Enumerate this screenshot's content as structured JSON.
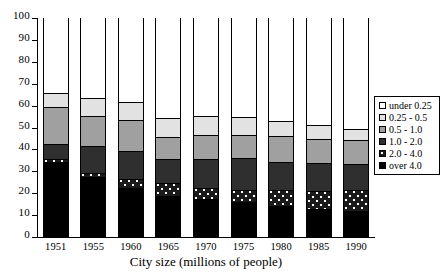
{
  "chart_data": {
    "type": "bar",
    "subtype": "stacked-bar-100-percent",
    "title": "",
    "xlabel": "City size (millions of people)",
    "ylabel": "",
    "ylim": [
      0,
      100
    ],
    "yticks": [
      0,
      10,
      20,
      30,
      40,
      50,
      60,
      70,
      80,
      90,
      100
    ],
    "grid": false,
    "legend_position": "right",
    "categories": [
      "1951",
      "1955",
      "1960",
      "1965",
      "1970",
      "1975",
      "1980",
      "1985",
      "1990"
    ],
    "series": [
      {
        "name": "over 4.0",
        "color": "#000000",
        "pattern": "solid-black",
        "values": [
          34.0,
          27.0,
          22.0,
          18.5,
          17.0,
          15.5,
          13.5,
          12.5,
          11.5
        ]
      },
      {
        "name": "2.0 - 4.0",
        "color": "#1a1a1a",
        "pattern": "dotted-dark",
        "values": [
          1.0,
          2.0,
          4.0,
          5.5,
          5.0,
          5.5,
          7.5,
          8.0,
          9.5
        ]
      },
      {
        "name": "1.0 - 2.0",
        "color": "#2f2f2f",
        "pattern": "solid-dark-gray",
        "values": [
          7.0,
          12.0,
          13.0,
          11.0,
          13.0,
          14.5,
          13.0,
          13.0,
          12.0
        ]
      },
      {
        "name": "0.5 - 1.0",
        "color": "#a0a0a0",
        "pattern": "solid-mid-gray",
        "values": [
          17.0,
          14.0,
          14.0,
          10.0,
          11.0,
          10.5,
          11.5,
          11.0,
          11.0
        ]
      },
      {
        "name": "0.25 - 0.5",
        "color": "#e2e2e2",
        "pattern": "solid-light-gray",
        "values": [
          6.5,
          8.0,
          8.0,
          9.0,
          9.0,
          8.5,
          7.0,
          6.0,
          5.0
        ]
      },
      {
        "name": "under 0.25",
        "color": "#ffffff",
        "pattern": "solid-white",
        "values": [
          34.5,
          37.0,
          39.0,
          46.0,
          45.0,
          45.5,
          47.5,
          49.5,
          51.0
        ]
      }
    ],
    "cumulative_tops": {
      "1951": [
        34.0,
        35.0,
        42.0,
        59.0,
        65.5,
        100
      ],
      "1955": [
        27.0,
        29.0,
        41.0,
        55.0,
        63.0,
        100
      ],
      "1960": [
        22.0,
        26.0,
        39.0,
        53.0,
        61.0,
        100
      ],
      "1965": [
        18.5,
        24.0,
        35.0,
        45.0,
        54.0,
        100
      ],
      "1970": [
        17.0,
        22.0,
        35.0,
        46.0,
        55.0,
        100
      ],
      "1975": [
        15.5,
        21.0,
        35.5,
        46.0,
        54.5,
        100
      ],
      "1980": [
        13.5,
        21.0,
        34.0,
        45.5,
        52.5,
        100
      ],
      "1985": [
        12.5,
        20.5,
        33.5,
        44.5,
        50.5,
        100
      ],
      "1990": [
        11.5,
        21.0,
        33.0,
        44.0,
        49.0,
        100
      ]
    }
  },
  "legend": {
    "items": [
      {
        "label": "under 0.25",
        "key": "under 0.25"
      },
      {
        "label": "0.25 - 0.5",
        "key": "0.25 - 0.5"
      },
      {
        "label": "0.5 - 1.0",
        "key": "0.5 - 1.0"
      },
      {
        "label": "1.0 - 2.0",
        "key": "1.0 - 2.0"
      },
      {
        "label": "2.0 - 4.0",
        "key": "2.0 - 4.0"
      },
      {
        "label": "over 4.0",
        "key": "over 4.0"
      }
    ]
  }
}
